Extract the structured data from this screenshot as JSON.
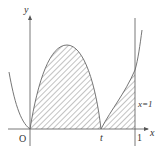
{
  "diagram": {
    "type": "function-graph-area",
    "axes": {
      "x_label": "x",
      "y_label": "y",
      "origin_label": "O"
    },
    "tick_labels": {
      "t": "t",
      "one": "1"
    },
    "vertical_line_label": "x=1",
    "shaded_regions": [
      {
        "from": "O",
        "to": "t",
        "description": "area under hump curve"
      },
      {
        "from": "t",
        "to": "1",
        "description": "area under rising curve up to x=1"
      }
    ],
    "colors": {
      "axis": "#555555",
      "curve": "#666666",
      "hatch": "#777777",
      "text": "#333333"
    }
  }
}
